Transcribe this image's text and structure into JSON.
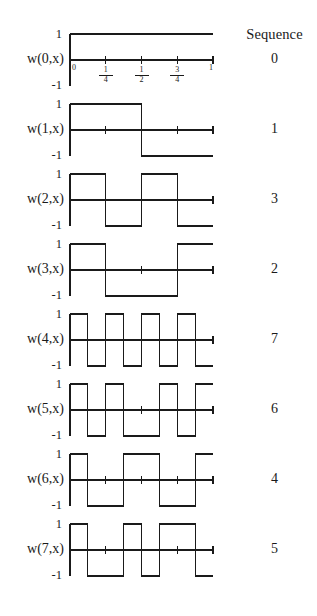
{
  "figure": {
    "title_column_header": "Sequence",
    "xaxis": {
      "tick_labels": [
        "0",
        "1/4",
        "1/2",
        "3/4",
        "1"
      ],
      "tick_positions": [
        0,
        0.25,
        0.5,
        0.75,
        1.0
      ],
      "range": [
        0,
        1
      ]
    },
    "yaxis": {
      "top_label": "1",
      "bottom_label": "-1",
      "range": [
        -1,
        1
      ]
    }
  },
  "chart_data": {
    "type": "line",
    "xlabel": "x",
    "ylabel": "w(n,x)",
    "xlim": [
      0,
      1
    ],
    "ylim": [
      -1,
      1
    ],
    "grid": false,
    "legend": "none",
    "x_tick_labels": [
      "0",
      "1/4",
      "1/2",
      "3/4",
      "1"
    ],
    "x_tick_values": [
      0,
      0.25,
      0.5,
      0.75,
      1
    ],
    "y_tick_labels": [
      "1",
      "-1"
    ],
    "y_tick_values": [
      1,
      -1
    ],
    "column_headers": [
      "",
      "Sequence"
    ],
    "series": [
      {
        "name": "w(0,x)",
        "sequence": "0",
        "segments": 8,
        "values": [
          1,
          1,
          1,
          1,
          1,
          1,
          1,
          1
        ]
      },
      {
        "name": "w(1,x)",
        "sequence": "1",
        "segments": 8,
        "values": [
          1,
          1,
          1,
          1,
          -1,
          -1,
          -1,
          -1
        ]
      },
      {
        "name": "w(2,x)",
        "sequence": "3",
        "segments": 8,
        "values": [
          1,
          1,
          -1,
          -1,
          1,
          1,
          -1,
          -1
        ]
      },
      {
        "name": "w(3,x)",
        "sequence": "2",
        "segments": 8,
        "values": [
          1,
          1,
          -1,
          -1,
          -1,
          -1,
          1,
          1
        ]
      },
      {
        "name": "w(4,x)",
        "sequence": "7",
        "segments": 8,
        "values": [
          1,
          -1,
          1,
          -1,
          1,
          -1,
          1,
          -1
        ]
      },
      {
        "name": "w(5,x)",
        "sequence": "6",
        "segments": 8,
        "values": [
          1,
          -1,
          1,
          -1,
          -1,
          1,
          -1,
          1
        ]
      },
      {
        "name": "w(6,x)",
        "sequence": "4",
        "segments": 8,
        "values": [
          1,
          -1,
          -1,
          1,
          1,
          -1,
          -1,
          1
        ]
      },
      {
        "name": "w(7,x)",
        "sequence": "5",
        "segments": 8,
        "values": [
          1,
          -1,
          -1,
          1,
          -1,
          1,
          1,
          -1
        ]
      }
    ]
  }
}
